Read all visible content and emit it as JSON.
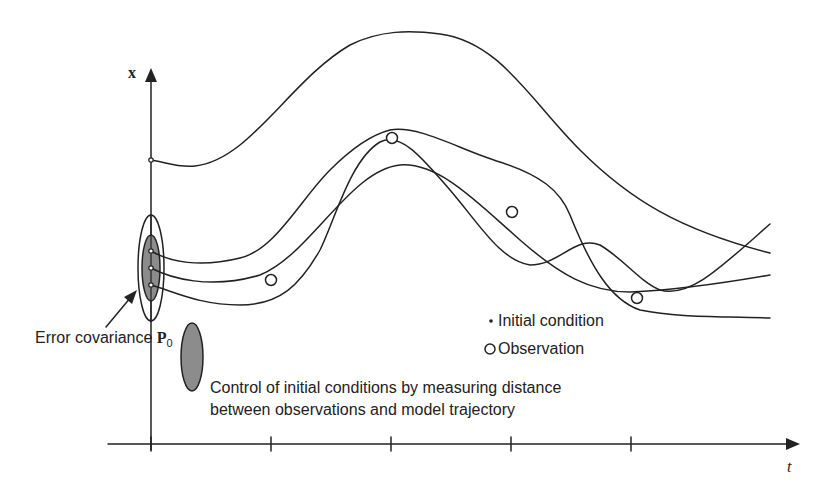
{
  "diagram": {
    "axes": {
      "y_label": "x",
      "x_label": "t",
      "x_ticks_count": 5
    },
    "labels": {
      "covariance_prefix": "Error covariance ",
      "covariance_symbol": "P",
      "covariance_subscript": "0",
      "legend_initial_condition": "Initial condition",
      "legend_observation": "Observation",
      "legend_initial_condition_symbol": "•",
      "legend_observation_symbol": "o",
      "control_line1": "Control of initial conditions by measuring distance",
      "control_line2": "between observations and model trajectory"
    },
    "elements": {
      "initial_conditions": 4,
      "observations": 4,
      "trajectories": 4
    },
    "colors": {
      "line": "#222222",
      "ellipse_fill": "#8c8c8c",
      "background": "#ffffff"
    }
  }
}
